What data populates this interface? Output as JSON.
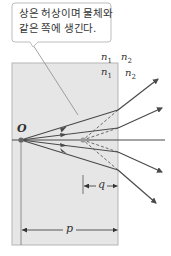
{
  "callout": {
    "line1": "상은 허상이며 물체와",
    "line2": "같은 쪽에 생긴다."
  },
  "labels": {
    "object": "O",
    "n1_outer": "n",
    "n1_outer_sub": "1",
    "n2_outer": "n",
    "n2_outer_sub": "2",
    "n1_inner": "n",
    "n1_inner_sub": "1",
    "n2_inner": "n",
    "n2_inner_sub": "2",
    "image_distance": "q",
    "object_distance": "p"
  },
  "colors": {
    "slab_fill": "#e6e6e6",
    "slab_border": "#b5b5b5",
    "ray": "#4a4a4a",
    "text": "#333333",
    "callout_border": "#bdbdbd"
  }
}
